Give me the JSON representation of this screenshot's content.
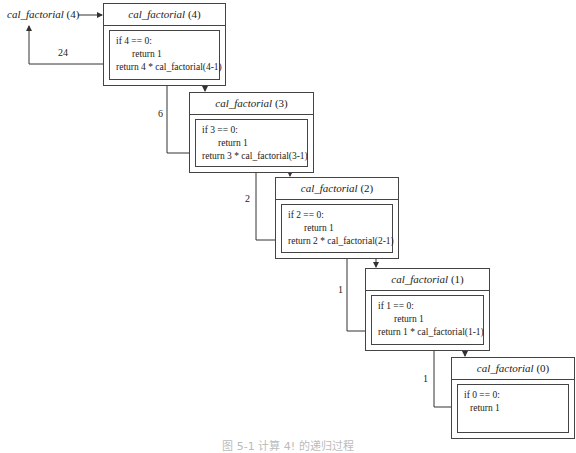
{
  "diagram": {
    "entry_call": {
      "func": "cal_factorial",
      "arg": "(4)"
    },
    "frames": [
      {
        "func": "cal_factorial",
        "arg": "(4)",
        "lines": [
          "if 4 == 0:",
          "return 1",
          "return 4 * cal_factorial(4-1)"
        ]
      },
      {
        "func": "cal_factorial",
        "arg": "(3)",
        "lines": [
          "if 3 == 0:",
          "return 1",
          "return 3 * cal_factorial(3-1)"
        ]
      },
      {
        "func": "cal_factorial",
        "arg": "(2)",
        "lines": [
          "if 2 == 0:",
          "return 1",
          "return 2 * cal_factorial(2-1)"
        ]
      },
      {
        "func": "cal_factorial",
        "arg": "(1)",
        "lines": [
          "if 1 == 0:",
          "return 1",
          "return 1 * cal_factorial(1-1)"
        ]
      },
      {
        "func": "cal_factorial",
        "arg": "(0)",
        "lines": [
          "if 0 == 0:",
          "return 1"
        ]
      }
    ],
    "return_values": [
      "24",
      "6",
      "2",
      "1",
      "1"
    ],
    "caption": "图 5-1  计算 4! 的递归过程"
  }
}
